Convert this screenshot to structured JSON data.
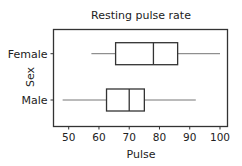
{
  "chart_data": {
    "type": "boxplot",
    "orientation": "horizontal",
    "title": "Resting pulse rate",
    "xlabel": "Pulse",
    "ylabel": "Sex",
    "xlim": [
      45,
      102.5
    ],
    "xticks": [
      50,
      60,
      70,
      80,
      90,
      100
    ],
    "grid": false,
    "legend": null,
    "categories": [
      "Female",
      "Male"
    ],
    "series": [
      {
        "name": "Female",
        "whisker_low": 57.5,
        "q1": 65.5,
        "median": 78,
        "q3": 86,
        "whisker_high": 100
      },
      {
        "name": "Male",
        "whisker_low": 48,
        "q1": 62.5,
        "median": 70,
        "q3": 75,
        "whisker_high": 92
      }
    ]
  },
  "colors": {
    "frame": "#333333",
    "box_stroke": "#333333",
    "whisker": "#666666",
    "text": "#222222"
  }
}
